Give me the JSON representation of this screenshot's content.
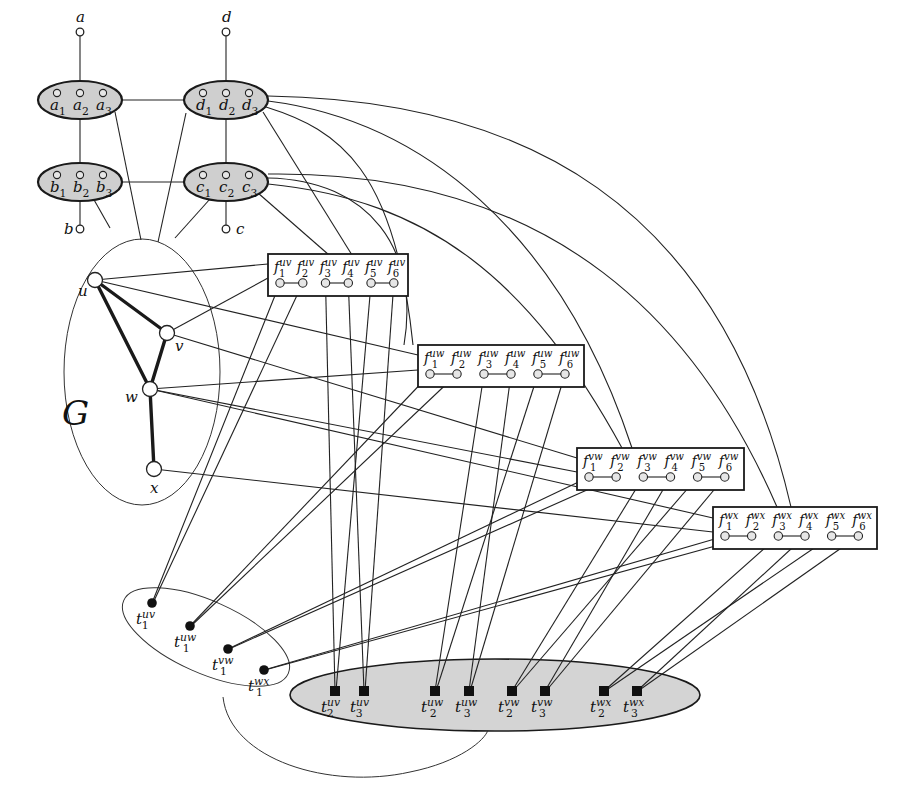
{
  "figure": {
    "graph_label": "G",
    "colors": {
      "line": "#222222",
      "gadget_fill": "#cfcfcf",
      "terminal_region_fill": "#d4d4d4",
      "background": "#ffffff"
    }
  },
  "gadgets": [
    {
      "id": "a",
      "label": "a",
      "cx": 80,
      "cy": 100,
      "rx": 42,
      "ry": 19,
      "pins": [
        "a",
        "a",
        "a"
      ],
      "subs": [
        "1",
        "2",
        "3"
      ],
      "ext_label": "a",
      "ext_x": 80,
      "ext_y": 32,
      "ext_label_pos": "top"
    },
    {
      "id": "d",
      "label": "d",
      "cx": 226,
      "cy": 100,
      "rx": 42,
      "ry": 19,
      "pins": [
        "d",
        "d",
        "d"
      ],
      "subs": [
        "1",
        "2",
        "3"
      ],
      "ext_label": "d",
      "ext_x": 226,
      "ext_y": 32,
      "ext_label_pos": "top"
    },
    {
      "id": "b",
      "label": "b",
      "cx": 80,
      "cy": 182,
      "rx": 42,
      "ry": 19,
      "pins": [
        "b",
        "b",
        "b"
      ],
      "subs": [
        "1",
        "2",
        "3"
      ],
      "ext_label": "b",
      "ext_x": 80,
      "ext_y": 229,
      "ext_label_pos": "left"
    },
    {
      "id": "c",
      "label": "c",
      "cx": 226,
      "cy": 182,
      "rx": 42,
      "ry": 19,
      "pins": [
        "c",
        "c",
        "c"
      ],
      "subs": [
        "1",
        "2",
        "3"
      ],
      "ext_label": "c",
      "ext_x": 226,
      "ext_y": 229,
      "ext_label_pos": "right"
    }
  ],
  "graph_vertices": [
    {
      "id": "u",
      "label": "u",
      "x": 95,
      "y": 280,
      "lx": 78,
      "ly": 296
    },
    {
      "id": "v",
      "label": "v",
      "x": 167,
      "y": 333,
      "lx": 175,
      "ly": 351
    },
    {
      "id": "w",
      "label": "w",
      "x": 150,
      "y": 389,
      "lx": 125,
      "ly": 402
    },
    {
      "id": "x",
      "label": "x",
      "x": 154,
      "y": 469,
      "lx": 150,
      "ly": 493
    }
  ],
  "graph_edges": [
    [
      "u",
      "v"
    ],
    [
      "u",
      "w"
    ],
    [
      "v",
      "w"
    ],
    [
      "w",
      "x"
    ]
  ],
  "f_boxes": [
    {
      "id": "uv",
      "sup": "uv",
      "x": 268,
      "y": 254,
      "w": 140,
      "h": 42,
      "labels": [
        "f",
        "f",
        "f",
        "f",
        "f",
        "f"
      ],
      "subs": [
        "1",
        "2",
        "3",
        "4",
        "5",
        "6"
      ]
    },
    {
      "id": "uw",
      "sup": "uw",
      "x": 418,
      "y": 345,
      "w": 166,
      "h": 42,
      "labels": [
        "f",
        "f",
        "f",
        "f",
        "f",
        "f"
      ],
      "subs": [
        "1",
        "2",
        "3",
        "4",
        "5",
        "6"
      ]
    },
    {
      "id": "vw",
      "sup": "vw",
      "x": 577,
      "y": 448,
      "w": 167,
      "h": 42,
      "labels": [
        "f",
        "f",
        "f",
        "f",
        "f",
        "f"
      ],
      "subs": [
        "1",
        "2",
        "3",
        "4",
        "5",
        "6"
      ]
    },
    {
      "id": "wx",
      "sup": "wx",
      "x": 713,
      "y": 507,
      "w": 164,
      "h": 42,
      "labels": [
        "f",
        "f",
        "f",
        "f",
        "f",
        "f"
      ],
      "subs": [
        "1",
        "2",
        "3",
        "4",
        "5",
        "6"
      ]
    }
  ],
  "t1_terminals": [
    {
      "label": "t",
      "sub": "1",
      "sup": "uv",
      "x": 152,
      "y": 603
    },
    {
      "label": "t",
      "sub": "1",
      "sup": "uw",
      "x": 190,
      "y": 626
    },
    {
      "label": "t",
      "sub": "1",
      "sup": "vw",
      "x": 228,
      "y": 649
    },
    {
      "label": "t",
      "sub": "1",
      "sup": "wx",
      "x": 264,
      "y": 670
    }
  ],
  "t23_terminals": [
    {
      "label": "t",
      "sub": "2",
      "sup": "uv",
      "x": 335,
      "y": 691
    },
    {
      "label": "t",
      "sub": "3",
      "sup": "uv",
      "x": 364,
      "y": 691
    },
    {
      "label": "t",
      "sub": "2",
      "sup": "uw",
      "x": 435,
      "y": 691
    },
    {
      "label": "t",
      "sub": "3",
      "sup": "uw",
      "x": 469,
      "y": 691
    },
    {
      "label": "t",
      "sub": "2",
      "sup": "vw",
      "x": 512,
      "y": 691
    },
    {
      "label": "t",
      "sub": "3",
      "sup": "vw",
      "x": 545,
      "y": 691
    },
    {
      "label": "t",
      "sub": "2",
      "sup": "wx",
      "x": 604,
      "y": 691
    },
    {
      "label": "t",
      "sub": "3",
      "sup": "wx",
      "x": 637,
      "y": 691
    }
  ]
}
